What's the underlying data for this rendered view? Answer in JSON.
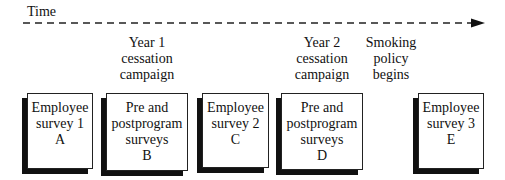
{
  "timeline": {
    "label": "Time",
    "arrow_color": "#111111"
  },
  "events": [
    {
      "lines": [
        "Year 1",
        "cessation",
        "campaign"
      ]
    },
    {
      "lines": [
        "Year 2",
        "cessation",
        "campaign"
      ]
    },
    {
      "lines": [
        "Smoking",
        "policy",
        "begins"
      ]
    }
  ],
  "boxes": [
    {
      "lines": [
        "Employee",
        "survey 1",
        "A"
      ]
    },
    {
      "lines": [
        "Pre and",
        "postprogram",
        "surveys",
        "B"
      ]
    },
    {
      "lines": [
        "Employee",
        "survey 2",
        "C"
      ]
    },
    {
      "lines": [
        "Pre and",
        "postprogram",
        "surveys",
        "D"
      ]
    },
    {
      "lines": [
        "Employee",
        "survey 3",
        "E"
      ]
    }
  ]
}
